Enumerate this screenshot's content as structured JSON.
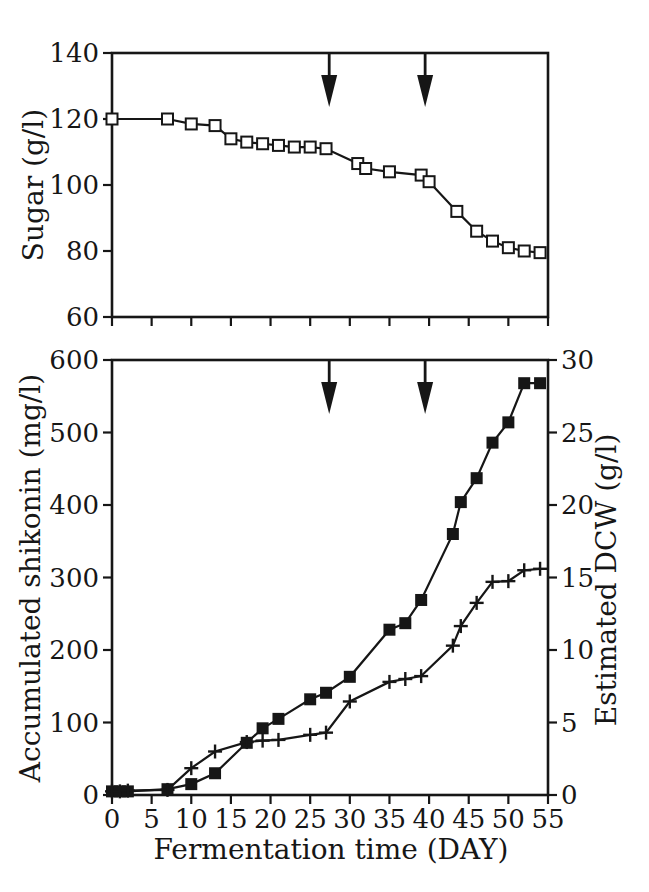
{
  "figure": {
    "kind": "scanned two-panel fermentation time-course figure",
    "background_color": "#ffffff",
    "ink_color": "#161616"
  },
  "chart_data": [
    {
      "type": "line",
      "id": "sugar-chart",
      "title": "",
      "xlabel": "",
      "ylabel": "Sugar (g/l)",
      "ylim": [
        60,
        140
      ],
      "yticks": [
        60,
        80,
        100,
        120,
        140
      ],
      "xlim": [
        0,
        55
      ],
      "xticks": [
        0,
        5,
        10,
        15,
        20,
        25,
        30,
        35,
        40,
        45,
        50,
        55
      ],
      "xtick_labels_shown": false,
      "grid": false,
      "legend": "none",
      "series": [
        {
          "name": "sugar",
          "marker": "open-square",
          "x": [
            0,
            7,
            10,
            13,
            15,
            17,
            19,
            21,
            23,
            25,
            27,
            31,
            32,
            35,
            39,
            40,
            43.5,
            46,
            48,
            50,
            52,
            54
          ],
          "y": [
            120,
            120,
            118.5,
            118,
            114,
            113,
            112.5,
            112,
            111.5,
            111.5,
            111,
            106.5,
            105,
            104,
            103,
            101,
            92,
            86,
            83,
            81,
            80,
            79.5
          ]
        }
      ],
      "annotations": [
        {
          "type": "down-arrow",
          "x": 27.4
        },
        {
          "type": "down-arrow",
          "x": 39.5
        }
      ]
    },
    {
      "type": "line",
      "id": "shikonin-dcw-chart",
      "title": "",
      "xlabel": "Fermentation time (DAY)",
      "ylabel_left": "Accumulated shikonin (mg/l)",
      "ylabel_right": "Estimated DCW (g/l)",
      "ylim_left": [
        0,
        600
      ],
      "yticks_left": [
        0,
        100,
        200,
        300,
        400,
        500,
        600
      ],
      "ylim_right": [
        0,
        30
      ],
      "yticks_right": [
        0,
        5,
        10,
        15,
        20,
        25,
        30
      ],
      "xlim": [
        0,
        55
      ],
      "xticks": [
        0,
        5,
        10,
        15,
        20,
        25,
        30,
        35,
        40,
        45,
        50,
        55
      ],
      "xtick_labels_shown": true,
      "grid": false,
      "legend": "none",
      "series": [
        {
          "name": "accumulated-shikonin",
          "axis": "left",
          "marker": "filled-square",
          "x": [
            0,
            1,
            2,
            7,
            10,
            13,
            17,
            19,
            21,
            25,
            27,
            30,
            35,
            37,
            39,
            43,
            44,
            46,
            48,
            50,
            52,
            54
          ],
          "y": [
            5,
            5,
            5,
            8,
            15,
            30,
            72,
            92,
            105,
            132,
            141,
            163,
            228,
            237,
            269,
            360,
            404,
            437,
            486,
            514,
            568,
            568
          ]
        },
        {
          "name": "estimated-dcw",
          "axis": "right",
          "marker": "plus",
          "x": [
            0,
            1,
            2,
            7,
            10,
            13,
            17,
            19,
            21,
            25,
            27,
            30,
            35,
            37,
            39,
            43,
            44,
            46,
            48,
            50,
            52,
            54
          ],
          "y": [
            0.25,
            0.25,
            0.3,
            0.35,
            1.85,
            3.0,
            3.65,
            3.75,
            3.8,
            4.15,
            4.3,
            6.45,
            7.8,
            8.0,
            8.2,
            10.3,
            11.65,
            13.25,
            14.7,
            14.75,
            15.5,
            15.6
          ]
        }
      ],
      "annotations": [
        {
          "type": "down-arrow",
          "x": 27.4
        },
        {
          "type": "down-arrow",
          "x": 39.5
        }
      ]
    }
  ]
}
